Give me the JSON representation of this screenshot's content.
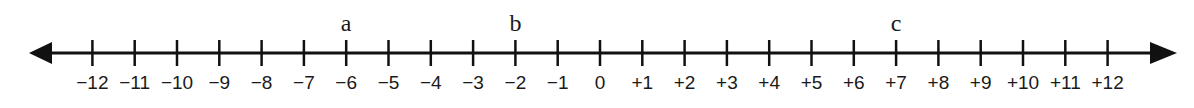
{
  "number_line": {
    "min": -12,
    "max": 12,
    "tick_labels": [
      "−12",
      "−11",
      "−10",
      "−9",
      "−8",
      "−7",
      "−6",
      "−5",
      "−4",
      "−3",
      "−2",
      "−1",
      "0",
      "+1",
      "+2",
      "+3",
      "+4",
      "+5",
      "+6",
      "+7",
      "+8",
      "+9",
      "+10",
      "+11",
      "+12"
    ],
    "arrows": [
      "left",
      "right"
    ],
    "points": [
      {
        "label": "a",
        "value": -6
      },
      {
        "label": "b",
        "value": -2
      },
      {
        "label": "c",
        "value": 7
      }
    ],
    "line_color": "#111111"
  }
}
